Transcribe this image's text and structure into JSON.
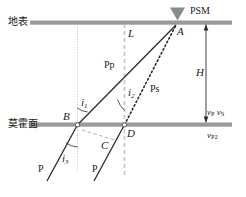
{
  "figure": {
    "title_alt": "Receiver function Ps conversion ray path diagram",
    "colors": {
      "interface": "#9a9a9a",
      "ray_solid": "#2b2b2b",
      "ray_dotted": "#2b2b2b",
      "guide_dashed": "#c0c0c0",
      "guide_dotted": "#b9b9b9",
      "helper_dashed": "#a8a8a8",
      "arrow": "#2b2b2b",
      "station_marker": "#7d7d7d",
      "text": "#1a1a1a",
      "background": "#ffffff"
    }
  },
  "interfaces": {
    "surface_label": "地表",
    "moho_label": "莫霍面"
  },
  "station": {
    "name": "PSM",
    "marker": "station-triangle-icon"
  },
  "points": {
    "A": "A",
    "B": "B",
    "C": "C",
    "D": "D"
  },
  "phases": {
    "pp": "Pp",
    "ps": "Ps",
    "p_left": "P",
    "p_right": "P"
  },
  "angles": {
    "i1": {
      "symbol": "i",
      "sub": "1"
    },
    "i2": {
      "symbol": "i",
      "sub": "2"
    },
    "i3": {
      "symbol": "i",
      "sub": "3"
    }
  },
  "distances": {
    "L": "L",
    "H": "H"
  },
  "velocities": {
    "above_p": {
      "symbol": "v",
      "sub": "P"
    },
    "above_s": {
      "symbol": "v",
      "sub": "S"
    },
    "below_p": {
      "symbol": "v",
      "sub": "P2"
    }
  }
}
